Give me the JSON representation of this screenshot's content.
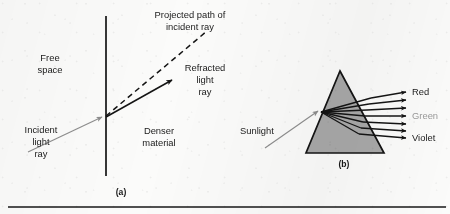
{
  "figure": {
    "background_color": "#fbfbfa",
    "ink_color": "#141414",
    "gray_ray_color": "#8d8d8d",
    "prism_fill_color": "#a8a8a8",
    "green_label_color": "#9a9a9a",
    "panel_a": {
      "id": "(a)",
      "labels": {
        "free_space": "Free\nspace",
        "free_space_line1": "Free",
        "free_space_line2": "space",
        "incident_light_ray_line1": "Incident",
        "incident_light_ray_line2": "light",
        "incident_light_ray_line3": "ray",
        "projected_path_line1": "Projected path of",
        "projected_path_line2": "incident ray",
        "refracted_ray_line1": "Refracted",
        "refracted_ray_line2": "light",
        "refracted_ray_line3": "ray",
        "denser_material_line1": "Denser",
        "denser_material_line2": "material"
      }
    },
    "panel_b": {
      "id": "(b)",
      "labels": {
        "sunlight": "Sunlight",
        "red": "Red",
        "green": "Green",
        "violet": "Violet"
      },
      "dispersed_ray_count": 7
    }
  }
}
